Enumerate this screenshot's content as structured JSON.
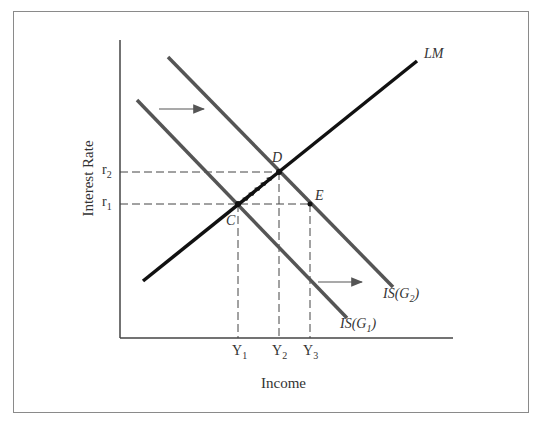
{
  "diagram": {
    "type": "IS-LM model",
    "axes": {
      "xlabel": "Income",
      "ylabel": "Interest Rate"
    },
    "curves": [
      {
        "id": "LM",
        "label": "LM"
      },
      {
        "id": "IS1",
        "label_main": "IS(G",
        "label_sub": "1",
        "label_close": ")"
      },
      {
        "id": "IS2",
        "label_main": "IS(G",
        "label_sub": "2",
        "label_close": ")"
      }
    ],
    "points": [
      {
        "id": "C",
        "label": "C"
      },
      {
        "id": "D",
        "label": "D"
      },
      {
        "id": "E",
        "label": "E"
      }
    ],
    "y_ticks": [
      {
        "main": "r",
        "sub": "2"
      },
      {
        "main": "r",
        "sub": "1"
      }
    ],
    "x_ticks": [
      {
        "main": "Y",
        "sub": "1"
      },
      {
        "main": "Y",
        "sub": "2"
      },
      {
        "main": "Y",
        "sub": "3"
      }
    ],
    "arrows": [
      "IS shift right (upper)",
      "IS shift right (lower)",
      "movement along LM from C to D"
    ],
    "colors": {
      "curves": "#555555",
      "lm": "#111111",
      "frame": "#8a8a8a",
      "text": "#333333"
    }
  }
}
